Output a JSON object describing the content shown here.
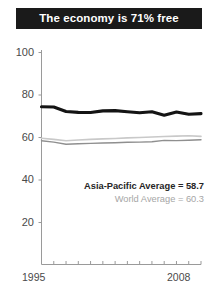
{
  "title": {
    "text": "The economy is 71% free"
  },
  "legend": {
    "region_label": "Asia-Pacific Average = 58.7",
    "world_label": "World Average = 60.3"
  },
  "axis": {
    "x_start_label": "1995",
    "x_end_label": "2008",
    "y_labels": [
      "100",
      "80",
      "60",
      "40",
      "20"
    ]
  },
  "colors": {
    "title_bar": "#1a1a1a",
    "title_text": "#ffffff",
    "country_line": "#141414",
    "region_line": "#8c8c8c",
    "world_line": "#c4c4c4",
    "axis": "#9a9a9a",
    "tick_text": "#4a4a4a"
  },
  "chart_data": {
    "type": "line",
    "title": "The economy is 71% free",
    "xlabel": "",
    "ylabel": "",
    "xlim": [
      1995,
      2008
    ],
    "ylim": [
      0,
      100
    ],
    "yticks": [
      20,
      40,
      60,
      80,
      100
    ],
    "xticks": [
      1995,
      1996,
      1997,
      1998,
      1999,
      2000,
      2001,
      2002,
      2003,
      2004,
      2005,
      2006,
      2007,
      2008
    ],
    "grid": false,
    "legend_position": "inside-right",
    "x": [
      1995,
      1996,
      1997,
      1998,
      1999,
      2000,
      2001,
      2002,
      2003,
      2004,
      2005,
      2006,
      2007,
      2008
    ],
    "series": [
      {
        "name": "Country economic freedom score",
        "style": "thick-black",
        "values": [
          74.2,
          74.1,
          72.0,
          71.6,
          71.5,
          72.3,
          72.4,
          71.9,
          71.4,
          71.9,
          70.2,
          71.8,
          70.7,
          71.0
        ]
      },
      {
        "name": "Asia-Pacific Average = 58.7",
        "style": "thin-grey",
        "values": [
          58.2,
          57.6,
          56.6,
          56.8,
          57.0,
          57.2,
          57.3,
          57.5,
          57.6,
          57.8,
          58.4,
          58.3,
          58.5,
          58.7
        ]
      },
      {
        "name": "World Average = 60.3",
        "style": "thin-light-grey",
        "values": [
          59.4,
          58.9,
          58.2,
          58.6,
          58.9,
          59.1,
          59.3,
          59.6,
          59.8,
          60.0,
          60.2,
          60.4,
          60.6,
          60.3
        ]
      }
    ]
  }
}
